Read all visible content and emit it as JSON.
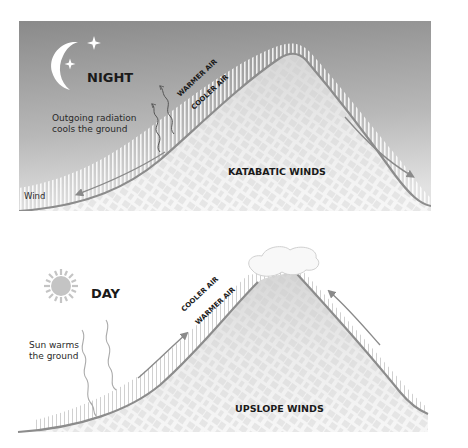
{
  "night": {
    "title": "NIGHT",
    "warmer_air": "WARMER AIR",
    "cooler_air": "COOLER AIR",
    "radiation_line1": "Outgoing radiation",
    "radiation_line2": "cools the ground",
    "wind_label": "Wind",
    "caption": "KATABATIC WINDS"
  },
  "day": {
    "title": "DAY",
    "cooler_air": "COOLER AIR",
    "warmer_air": "WARMER AIR",
    "sun_line1": "Sun warms",
    "sun_line2": "the ground",
    "caption": "UPSLOPE WINDS"
  },
  "colors": {
    "sky_dark": "#8a8a8a",
    "sky_light": "#d9d9d9",
    "ground_line": "#8c8c8c",
    "mountain_fill": "#f2f2f2",
    "hatch": "#ffffff",
    "day_hatch": "#c8c8c8",
    "sun": "#c4c4c4"
  }
}
